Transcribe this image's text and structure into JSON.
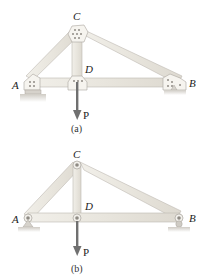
{
  "figure_a": {
    "caption": "(a)",
    "description": "Riveted truss with gusset plates",
    "labels": {
      "A": "A",
      "B": "B",
      "C": "C",
      "D": "D",
      "P": "P"
    },
    "members": [
      "AC",
      "CB",
      "CD",
      "AD",
      "DB"
    ],
    "supports": {
      "A": "fixed pin (hatched base)",
      "B": "rocker/roller"
    },
    "load": {
      "at": "D",
      "direction": "down",
      "label": "P"
    }
  },
  "figure_b": {
    "caption": "(b)",
    "description": "Idealized pin-jointed truss",
    "labels": {
      "A": "A",
      "B": "B",
      "C": "C",
      "D": "D",
      "P": "P"
    },
    "members": [
      "AC",
      "CB",
      "CD",
      "AD",
      "DB"
    ],
    "supports": {
      "A": "pin",
      "B": "roller"
    },
    "load": {
      "at": "D",
      "direction": "down",
      "label": "P"
    }
  },
  "colors": {
    "member_fill": "#ece9e2",
    "member_stroke": "#b9b5ad",
    "plate_fill": "#f3f1ec",
    "arrow": "#6f6f6f",
    "ground": "#c9c6c0"
  }
}
